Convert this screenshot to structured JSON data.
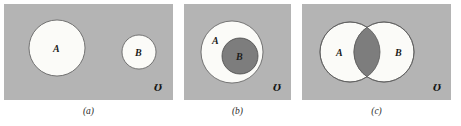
{
  "figure": {
    "page_background": "#ffffff",
    "panel_background": "#b4b4b4",
    "region_fill": "#fbfbf8",
    "intersection_fill": "#7d7d7d",
    "outline_color": "#555555",
    "universe_symbol": "Ʊ"
  },
  "panels": [
    {
      "id": "a",
      "caption": "(a)",
      "relation": "disjoint",
      "universe_symbol": "Ʊ",
      "sets": [
        {
          "label": "A",
          "cx": 53,
          "cy": 44,
          "r": 28,
          "fill": "#fbfbf8"
        },
        {
          "label": "B",
          "cx": 135,
          "cy": 48,
          "r": 17,
          "fill": "#fbfbf8"
        }
      ]
    },
    {
      "id": "b",
      "caption": "(b)",
      "relation": "subset",
      "universe_symbol": "Ʊ",
      "sets": [
        {
          "label": "A",
          "cx": 48,
          "cy": 48,
          "r": 31,
          "fill": "#fbfbf8"
        },
        {
          "label": "B",
          "cx": 56,
          "cy": 52,
          "r": 18,
          "fill": "#7d7d7d"
        }
      ]
    },
    {
      "id": "c",
      "caption": "(c)",
      "relation": "intersecting",
      "universe_symbol": "Ʊ",
      "sets": [
        {
          "label": "A",
          "cx": 48,
          "cy": 48,
          "r": 30,
          "fill": "#fbfbf8"
        },
        {
          "label": "B",
          "cx": 82,
          "cy": 48,
          "r": 30,
          "fill": "#fbfbf8"
        }
      ]
    }
  ]
}
